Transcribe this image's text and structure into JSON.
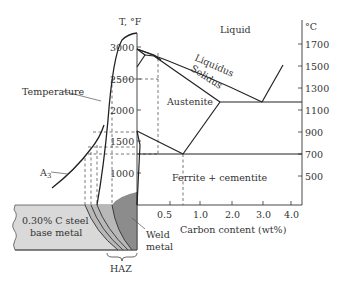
{
  "figure": {
    "axis_left": {
      "title": "T, °F",
      "ticks": [
        "3000",
        "2500",
        "2000",
        "1500",
        "1000"
      ]
    },
    "axis_right": {
      "title": "°C",
      "ticks": [
        "1700",
        "1500",
        "1300",
        "1100",
        "900",
        "700",
        "500"
      ]
    },
    "axis_bottom": {
      "title": "Carbon content (wt%)",
      "ticks": [
        "0.5",
        "1.0",
        "2.0",
        "3.0",
        "4.0"
      ]
    },
    "regions": {
      "liquid": "Liquid",
      "austenite": "Austenite",
      "ferrite_cementite": "Ferrite + cementite"
    },
    "curves": {
      "liquidus": "Liquidus",
      "solidus": "Solidus",
      "temperature": "Temperature",
      "a3": "A3"
    },
    "weld": {
      "base_metal_line1": "0.30% C steel",
      "base_metal_line2": "base metal",
      "weld_metal_line1": "Weld",
      "weld_metal_line2": "metal",
      "haz": "HAZ"
    },
    "colors": {
      "line": "#2a2a2a",
      "base_metal": "#d9d9d9",
      "haz_band": "#b8b8b8",
      "weld_metal": "#8c8c8c",
      "text": "#333333"
    }
  }
}
